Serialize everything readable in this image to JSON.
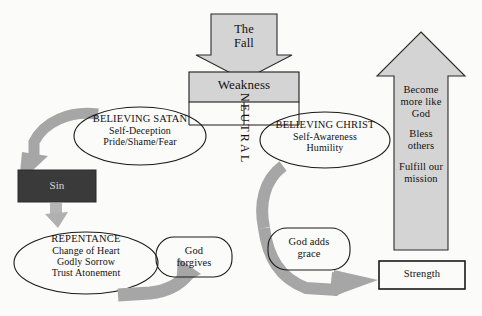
{
  "diagram": {
    "colors": {
      "arrow_gray": "#a3a3a3",
      "fill_light_gray": "#d4d4d4",
      "fill_sin_dark": "#3a3a3a",
      "sin_text": "#d9d9d9",
      "stroke_black": "#1a1a1a",
      "background": "#fbfbfa"
    },
    "nodes": {
      "the_fall": {
        "shape": "down-arrow",
        "line1": "The",
        "line2": "Fall"
      },
      "weakness": {
        "shape": "rectangle",
        "label": "Weakness"
      },
      "believing_satan": {
        "shape": "ellipse",
        "heading": "BELIEVING SATAN",
        "line2": "Self-Deception",
        "line3": "Pride/Shame/Fear"
      },
      "believing_christ": {
        "shape": "ellipse",
        "heading": "BELIEVING CHRIST",
        "line2": "Self-Awareness",
        "line3": "Humility"
      },
      "neutral": {
        "shape": "vertical-text",
        "label": "NEUTRAL"
      },
      "sin": {
        "shape": "filled-rectangle",
        "label": "Sin"
      },
      "repentance": {
        "shape": "ellipse",
        "heading": "REPENTANCE",
        "line2": "Change of Heart",
        "line3": "Godly Sorrow",
        "line4": "Trust Atonement"
      },
      "god_forgives": {
        "shape": "rounded-rectangle",
        "line1": "God",
        "line2": "forgives"
      },
      "god_adds_grace": {
        "shape": "rounded-rectangle",
        "line1": "God adds",
        "line2": "grace"
      },
      "up_arrow": {
        "shape": "up-arrow",
        "group1_line1": "Become",
        "group1_line2": "more like",
        "group1_line3": "God",
        "group2_line1": "Bless",
        "group2_line2": "others",
        "group3_line1": "Fulfill our",
        "group3_line2": "mission"
      },
      "strength": {
        "shape": "rectangle",
        "label": "Strength"
      }
    },
    "connectors": [
      {
        "name": "fall-to-weakness",
        "from": "the_fall",
        "to": "weakness",
        "style": "gray-block-arrow-down"
      },
      {
        "name": "weakness-to-believing-satan",
        "from": "weakness",
        "to": "believing_satan",
        "style": "thin-line"
      },
      {
        "name": "weakness-to-believing-christ",
        "from": "weakness",
        "to": "believing_christ",
        "style": "thin-line"
      },
      {
        "name": "believing-satan-to-sin",
        "from": "believing_satan",
        "to": "sin",
        "style": "curved-gray-arrow"
      },
      {
        "name": "sin-to-repentance",
        "from": "sin",
        "to": "repentance",
        "style": "short-gray-arrow"
      },
      {
        "name": "repentance-to-god-forgives",
        "from": "repentance",
        "to": "god_forgives",
        "style": "thick-gray-arrow"
      },
      {
        "name": "believing-christ-to-god-adds-grace",
        "from": "believing_christ",
        "to": "god_adds_grace",
        "style": "curved-gray-arrow"
      },
      {
        "name": "god-adds-grace-to-strength",
        "from": "god_adds_grace",
        "to": "strength",
        "style": "curved-gray-arrow"
      }
    ]
  }
}
